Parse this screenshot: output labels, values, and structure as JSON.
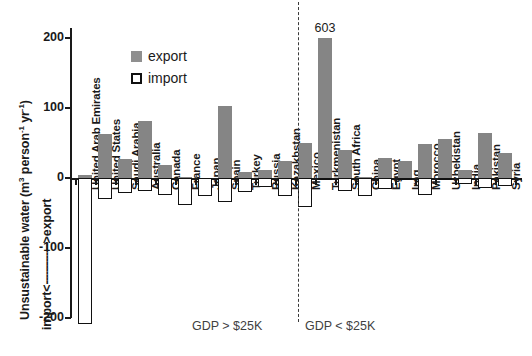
{
  "chart_data": {
    "type": "bar",
    "title": "",
    "ylabel": "Unsustainable water (m3 person-1 yr-1)",
    "ylabel_parts": {
      "text_a": "Unsustainable water (m",
      "sup_a": "3",
      "text_b": " person",
      "sup_b": "-1",
      "text_c": " yr",
      "sup_c": "-1",
      "text_d": ")"
    },
    "ydirection_label": "import <-------------> export",
    "ydirection_parts": {
      "import": "import",
      "arrow_left": "<",
      "dashes": "-------------",
      "arrow_right": ">",
      "export": "export"
    },
    "xlabel": "",
    "ylim": [
      -200,
      200
    ],
    "yticks": [
      200,
      100,
      0,
      -100,
      -200
    ],
    "ytick_labels": [
      "200",
      "100",
      "0",
      "-100",
      "-200"
    ],
    "grid": false,
    "legend_position": "upper-left-inside",
    "legend": [
      {
        "name": "export",
        "color": "#858585",
        "style": "filled"
      },
      {
        "name": "import",
        "color": "#ffffff",
        "style": "outlined"
      }
    ],
    "series": [
      {
        "name": "export",
        "color": "#858585"
      },
      {
        "name": "import",
        "color": "#ffffff"
      }
    ],
    "categories": [
      "United Arab Emirates",
      "United States",
      "Saudi Arabia",
      "Australia",
      "Canada",
      "France",
      "Japan",
      "Spain",
      "Turkey",
      "Russia",
      "Kazakhstan",
      "Mexico",
      "Turkmenistan",
      "South Africa",
      "China",
      "Egypt",
      "Iraq",
      "Morocco",
      "Uzbekistan",
      "India",
      "Pakistan",
      "Syria"
    ],
    "export_values": [
      4,
      63,
      27,
      81,
      18,
      2,
      0,
      103,
      9,
      11,
      25,
      50,
      603,
      40,
      1,
      28,
      25,
      48,
      56,
      12,
      65,
      36
    ],
    "import_values": [
      -275,
      -30,
      -22,
      -18,
      -24,
      -38,
      -26,
      -34,
      -20,
      -13,
      -26,
      -42,
      0,
      -18,
      -26,
      -16,
      -3,
      -24,
      -2,
      -9,
      -14,
      -12
    ],
    "annotations": [
      {
        "category": "Turkmenistan",
        "text": "603",
        "note": "bar truncated at axis maximum"
      }
    ],
    "groups": [
      {
        "label": "GDP > $25K",
        "categories": [
          "United Arab Emirates",
          "United States",
          "Saudi Arabia",
          "Australia",
          "Canada",
          "France",
          "Japan",
          "Spain",
          "Turkey",
          "Russia"
        ]
      },
      {
        "label": "GDP < $25K",
        "categories": [
          "Kazakhstan",
          "Mexico",
          "Turkmenistan",
          "South Africa",
          "China",
          "Egypt",
          "Iraq",
          "Morocco",
          "Uzbekistan",
          "India",
          "Pakistan",
          "Syria"
        ]
      }
    ],
    "colors": {
      "export_fill": "#858585",
      "import_fill": "#ffffff",
      "import_stroke": "#111111",
      "axis": "#1a1a1a",
      "divider": "#3a3a3a",
      "caption": "#3f3f3f",
      "background": "#ffffff"
    }
  }
}
